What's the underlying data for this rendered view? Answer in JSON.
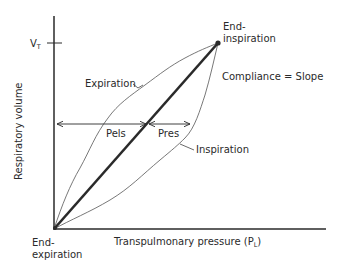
{
  "diagram": {
    "axes": {
      "y_label": "Respiratory volume",
      "y_tick_label": "V",
      "y_tick_subscript": "T",
      "x_label_main": "Transpulmonary pressure (P",
      "x_label_subscript": "L",
      "x_label_close": ")"
    },
    "points": {
      "end_inspiration_line1": "End-",
      "end_inspiration_line2": "inspiration",
      "end_expiration_line1": "End-",
      "end_expiration_line2": "expiration"
    },
    "curves": {
      "expiration": "Expiration",
      "inspiration": "Inspiration"
    },
    "annotations": {
      "compliance": "Compliance = Slope",
      "pels": "Pels",
      "pres": "Pres"
    },
    "colors": {
      "line": "#2a2a2a",
      "curve": "#555555",
      "background": "#ffffff"
    }
  }
}
